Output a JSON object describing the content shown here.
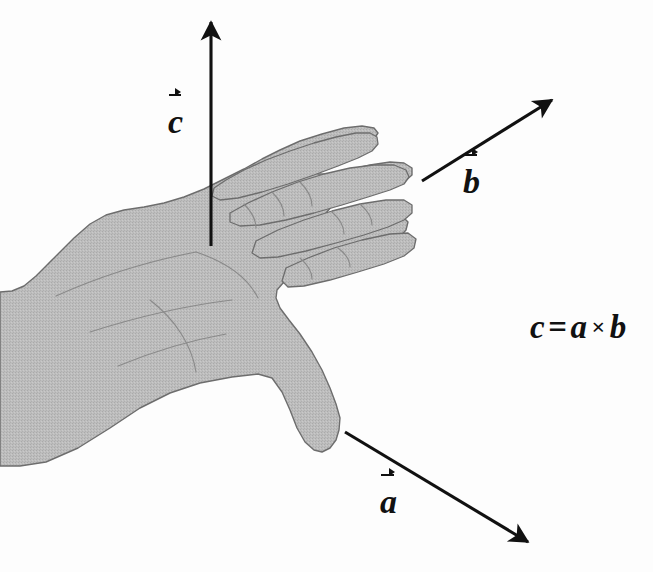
{
  "figure": {
    "background_color": "#fdfdfd",
    "ink_color": "#111111",
    "hand_fill_color": "#b8b8b8",
    "hand_outline_color": "#6d6d6d",
    "width": 653,
    "height": 572
  },
  "labels": {
    "c": "c",
    "b": "b",
    "a": "a"
  },
  "equation": {
    "lhs": "c",
    "equals": "=",
    "rhs_first": "a",
    "times": "×",
    "rhs_second": "b",
    "plain_text": "c⃗ = a⃗ × b⃗"
  },
  "vectors": [
    {
      "name": "c",
      "label": "c",
      "meaning": "cross product result, perpendicular to palm (thumb-up normal)",
      "direction": "up",
      "start": [
        211,
        246
      ],
      "end": [
        211,
        18
      ],
      "color": "#111111"
    },
    {
      "name": "b",
      "label": "b",
      "meaning": "second vector, along the curled fingers direction",
      "direction": "upper-right",
      "start": [
        422,
        181
      ],
      "end": [
        557,
        97
      ],
      "color": "#111111"
    },
    {
      "name": "a",
      "label": "a",
      "meaning": "first vector, along the thumb direction",
      "direction": "lower-right",
      "start": [
        345,
        432
      ],
      "end": [
        533,
        545
      ],
      "color": "#111111"
    }
  ],
  "hand": {
    "name": "right-hand-illustration",
    "description": "Shaded right hand, palm facing up, fingers extended to the upper right and thumb extended down to the lower right",
    "fill": "#b8b8b8",
    "stroke": "#6d6d6d"
  }
}
